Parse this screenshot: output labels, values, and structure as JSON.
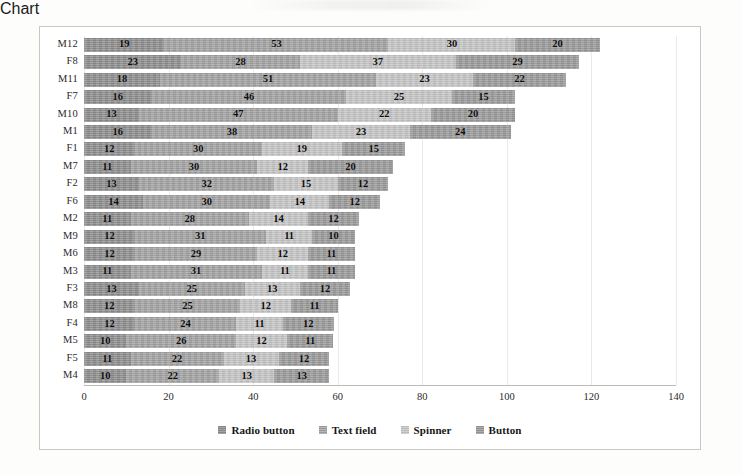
{
  "chart_data": {
    "type": "bar",
    "orientation": "horizontal",
    "stacked": true,
    "title": "",
    "xlabel": "",
    "ylabel": "",
    "xlim": [
      0,
      140
    ],
    "xticks": [
      0,
      20,
      40,
      60,
      80,
      100,
      120,
      140
    ],
    "grid": true,
    "legend_position": "bottom",
    "categories": [
      "M12",
      "F8",
      "M11",
      "F7",
      "M10",
      "M1",
      "F1",
      "M7",
      "F2",
      "F6",
      "M2",
      "M9",
      "M6",
      "M3",
      "F3",
      "M8",
      "F4",
      "M5",
      "F5",
      "M4"
    ],
    "series": [
      {
        "name": "Radio button",
        "color": "#8e8e8e",
        "values": [
          19,
          23,
          18,
          16,
          13,
          16,
          12,
          11,
          13,
          14,
          11,
          12,
          12,
          11,
          13,
          12,
          12,
          10,
          11,
          10
        ]
      },
      {
        "name": "Text field",
        "color": "#a3a3a3",
        "values": [
          53,
          28,
          51,
          46,
          47,
          38,
          30,
          30,
          32,
          30,
          28,
          31,
          29,
          31,
          25,
          25,
          24,
          26,
          22,
          22
        ]
      },
      {
        "name": "Spinner",
        "color": "#c6c6c6",
        "values": [
          30,
          37,
          23,
          25,
          22,
          23,
          19,
          12,
          15,
          14,
          14,
          11,
          12,
          11,
          13,
          12,
          11,
          12,
          13,
          13
        ]
      },
      {
        "name": "Button",
        "color": "#9a9a9a",
        "values": [
          20,
          29,
          22,
          15,
          20,
          24,
          15,
          20,
          12,
          12,
          12,
          10,
          11,
          11,
          12,
          11,
          12,
          11,
          12,
          13
        ]
      }
    ],
    "totals": [
      122,
      117,
      114,
      102,
      102,
      101,
      76,
      73,
      72,
      70,
      65,
      64,
      64,
      64,
      63,
      60,
      59,
      59,
      58,
      58
    ]
  }
}
